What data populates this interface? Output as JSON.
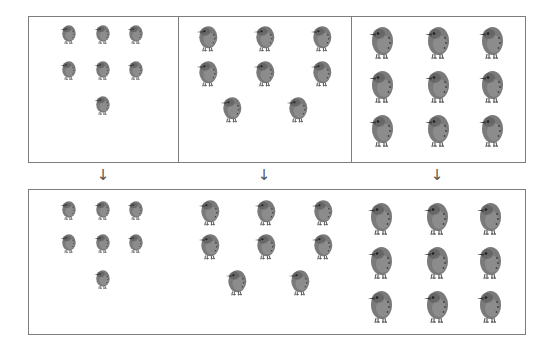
{
  "diagram": {
    "top_panels": [
      {
        "label": "group-1",
        "count": 7,
        "bird_size": "small"
      },
      {
        "label": "group-2",
        "count": 8,
        "bird_size": "medium"
      },
      {
        "label": "group-3",
        "count": 9,
        "bird_size": "large"
      }
    ],
    "arrows": [
      {
        "glyph": "↓",
        "x": 96,
        "y": 168
      },
      {
        "glyph": "↓",
        "x": 257,
        "y": 168
      },
      {
        "glyph": "↓",
        "x": 430,
        "y": 168
      }
    ],
    "bottom_panel": {
      "label": "combined",
      "count": 24
    },
    "colors": {
      "border": "#7d7d7d",
      "bird_body": "#7a7a7a",
      "bird_shade": "#5e5e5e",
      "bird_light": "#9a9a9a",
      "arrow": "#555555"
    },
    "sizes": {
      "small": {
        "w": 18,
        "h": 22
      },
      "medium": {
        "w": 24,
        "h": 30
      },
      "large": {
        "w": 28,
        "h": 38
      }
    },
    "birds": [
      {
        "cx": 68,
        "cy": 34,
        "size": "small"
      },
      {
        "cx": 102,
        "cy": 34,
        "size": "small"
      },
      {
        "cx": 135,
        "cy": 34,
        "size": "small"
      },
      {
        "cx": 68,
        "cy": 70,
        "size": "small"
      },
      {
        "cx": 102,
        "cy": 70,
        "size": "small"
      },
      {
        "cx": 135,
        "cy": 70,
        "size": "small"
      },
      {
        "cx": 102,
        "cy": 105,
        "size": "small"
      },
      {
        "cx": 207,
        "cy": 38,
        "size": "medium"
      },
      {
        "cx": 264,
        "cy": 38,
        "size": "medium"
      },
      {
        "cx": 321,
        "cy": 38,
        "size": "medium"
      },
      {
        "cx": 207,
        "cy": 73,
        "size": "medium"
      },
      {
        "cx": 264,
        "cy": 73,
        "size": "medium"
      },
      {
        "cx": 321,
        "cy": 73,
        "size": "medium"
      },
      {
        "cx": 231,
        "cy": 109,
        "size": "medium"
      },
      {
        "cx": 297,
        "cy": 109,
        "size": "medium"
      },
      {
        "cx": 381,
        "cy": 42,
        "size": "large"
      },
      {
        "cx": 437,
        "cy": 42,
        "size": "large"
      },
      {
        "cx": 491,
        "cy": 42,
        "size": "large"
      },
      {
        "cx": 381,
        "cy": 86,
        "size": "large"
      },
      {
        "cx": 437,
        "cy": 86,
        "size": "large"
      },
      {
        "cx": 491,
        "cy": 86,
        "size": "large"
      },
      {
        "cx": 381,
        "cy": 130,
        "size": "large"
      },
      {
        "cx": 437,
        "cy": 130,
        "size": "large"
      },
      {
        "cx": 491,
        "cy": 130,
        "size": "large"
      },
      {
        "cx": 68,
        "cy": 210,
        "size": "small"
      },
      {
        "cx": 102,
        "cy": 210,
        "size": "small"
      },
      {
        "cx": 135,
        "cy": 210,
        "size": "small"
      },
      {
        "cx": 68,
        "cy": 243,
        "size": "small"
      },
      {
        "cx": 102,
        "cy": 243,
        "size": "small"
      },
      {
        "cx": 135,
        "cy": 243,
        "size": "small"
      },
      {
        "cx": 102,
        "cy": 279,
        "size": "small"
      },
      {
        "cx": 209,
        "cy": 212,
        "size": "medium"
      },
      {
        "cx": 265,
        "cy": 212,
        "size": "medium"
      },
      {
        "cx": 322,
        "cy": 212,
        "size": "medium"
      },
      {
        "cx": 209,
        "cy": 246,
        "size": "medium"
      },
      {
        "cx": 265,
        "cy": 246,
        "size": "medium"
      },
      {
        "cx": 322,
        "cy": 246,
        "size": "medium"
      },
      {
        "cx": 236,
        "cy": 282,
        "size": "medium"
      },
      {
        "cx": 299,
        "cy": 282,
        "size": "medium"
      },
      {
        "cx": 380,
        "cy": 218,
        "size": "large"
      },
      {
        "cx": 436,
        "cy": 218,
        "size": "large"
      },
      {
        "cx": 489,
        "cy": 218,
        "size": "large"
      },
      {
        "cx": 380,
        "cy": 262,
        "size": "large"
      },
      {
        "cx": 436,
        "cy": 262,
        "size": "large"
      },
      {
        "cx": 489,
        "cy": 262,
        "size": "large"
      },
      {
        "cx": 380,
        "cy": 306,
        "size": "large"
      },
      {
        "cx": 436,
        "cy": 306,
        "size": "large"
      },
      {
        "cx": 489,
        "cy": 306,
        "size": "large"
      }
    ]
  }
}
